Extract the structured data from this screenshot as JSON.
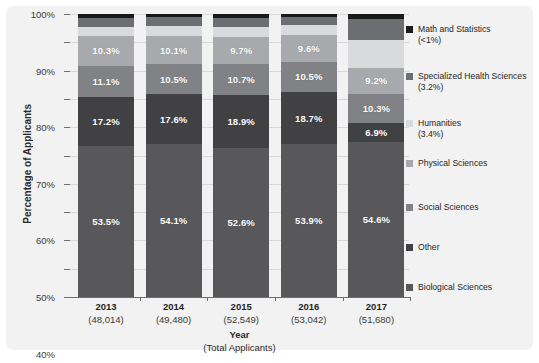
{
  "chart_data": {
    "type": "bar",
    "subtype": "stacked-percentage",
    "title": "",
    "xlabel": "Year",
    "xlabel_sub": "(Total Applicants)",
    "ylabel": "Percentage of Applicants",
    "ylim": [
      0,
      100
    ],
    "ytick_labels": [
      "0%",
      "10%",
      "20%",
      "30%",
      "40%",
      "50%",
      "60%",
      "70%",
      "80%",
      "90%",
      "100%"
    ],
    "ytick_values": [
      0,
      10,
      20,
      30,
      40,
      50,
      60,
      70,
      80,
      90,
      100
    ],
    "grid": true,
    "legend_position": "right",
    "categories": [
      "2013",
      "2014",
      "2015",
      "2016",
      "2017"
    ],
    "category_totals": [
      "(48,014)",
      "(49,480)",
      "(52,549)",
      "(53,042)",
      "(51,680)"
    ],
    "series": [
      {
        "name": "Biological Sciences",
        "color": "#58585a",
        "values": [
          53.5,
          54.1,
          52.6,
          53.9,
          54.6
        ],
        "labels": [
          "53.5%",
          "54.1%",
          "52.6%",
          "53.9%",
          "54.6%"
        ]
      },
      {
        "name": "Other",
        "color": "#414042",
        "values": [
          17.2,
          17.6,
          18.9,
          18.7,
          6.9
        ],
        "labels": [
          "17.2%",
          "17.6%",
          "18.9%",
          "18.7%",
          "6.9%"
        ]
      },
      {
        "name": "Social Sciences",
        "color": "#808285",
        "values": [
          11.1,
          10.5,
          10.7,
          10.5,
          10.3
        ],
        "labels": [
          "11.1%",
          "10.5%",
          "10.7%",
          "10.5%",
          "10.3%"
        ]
      },
      {
        "name": "Physical Sciences",
        "color": "#a7a9ac",
        "values": [
          10.3,
          10.1,
          9.7,
          9.6,
          9.2
        ],
        "labels": [
          "10.3%",
          "10.1%",
          "9.7%",
          "9.6%",
          "9.2%"
        ]
      },
      {
        "name": "Humanities",
        "color": "#d9dadb",
        "values": [
          3.4,
          3.4,
          3.4,
          3.4,
          9.9
        ],
        "labels": [
          "",
          "",
          "",
          "",
          ""
        ]
      },
      {
        "name": "Specialized Health Sciences",
        "color": "#6d6e71",
        "values": [
          3.2,
          3.2,
          3.4,
          3.0,
          7.4
        ],
        "labels": [
          "",
          "",
          "",
          "",
          ""
        ]
      },
      {
        "name": "Math and Statistics",
        "color": "#1a1a1a",
        "values": [
          1.3,
          1.1,
          1.3,
          0.9,
          1.7
        ],
        "labels": [
          "",
          "",
          "",
          "",
          ""
        ]
      }
    ]
  },
  "legend": {
    "items": [
      {
        "label": "Math and Statistics",
        "sub": "(<1%)",
        "color": "#1a1a1a"
      },
      {
        "label": "Specialized Health Sciences",
        "sub": "(3.2%)",
        "color": "#6d6e71"
      },
      {
        "label": "Humanities",
        "sub": "(3.4%)",
        "color": "#d9dadb"
      },
      {
        "label": "Physical Sciences",
        "sub": "",
        "color": "#a7a9ac"
      },
      {
        "label": "Social Sciences",
        "sub": "",
        "color": "#808285"
      },
      {
        "label": "Other",
        "sub": "",
        "color": "#414042"
      },
      {
        "label": "Biological Sciences",
        "sub": "",
        "color": "#58585a"
      }
    ]
  }
}
